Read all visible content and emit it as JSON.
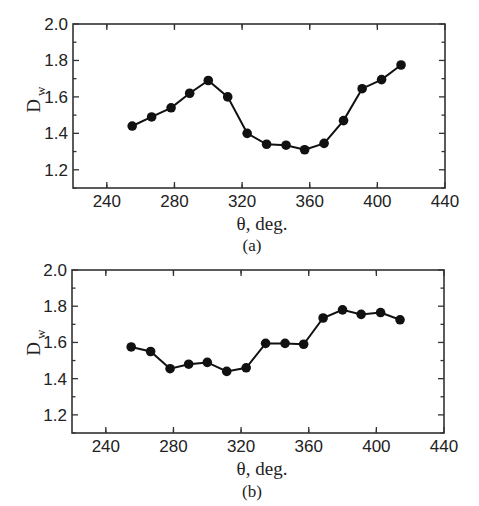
{
  "chart_data": [
    {
      "type": "line",
      "panel_label": "(a)",
      "title": "",
      "xlabel": "θ, deg.",
      "ylabel": "D_w",
      "xlim": [
        220,
        440
      ],
      "ylim": [
        1.1,
        2.0
      ],
      "xticks": [
        240,
        280,
        320,
        360,
        400,
        440
      ],
      "yticks": [
        1.2,
        1.4,
        1.6,
        1.8,
        2.0
      ],
      "xtick_labels": [
        "240",
        "280",
        "320",
        "360",
        "400",
        "440"
      ],
      "ytick_labels": [
        "1.2",
        "1.4",
        "1.6",
        "1.8",
        "2.0"
      ],
      "grid": false,
      "series": [
        {
          "name": "D_w",
          "marker": "filled-circle",
          "x": [
            255,
            266.5,
            278,
            289,
            300,
            311.5,
            323,
            334.5,
            346,
            357,
            368.5,
            380,
            391,
            402.5,
            414
          ],
          "values": [
            1.44,
            1.49,
            1.54,
            1.62,
            1.69,
            1.6,
            1.4,
            1.34,
            1.335,
            1.31,
            1.345,
            1.47,
            1.645,
            1.695,
            1.775
          ]
        }
      ]
    },
    {
      "type": "line",
      "panel_label": "(b)",
      "title": "",
      "xlabel": "θ, deg.",
      "ylabel": "D_w",
      "xlim": [
        220,
        440
      ],
      "ylim": [
        1.1,
        2.0
      ],
      "xticks": [
        240,
        280,
        320,
        360,
        400,
        440
      ],
      "yticks": [
        1.2,
        1.4,
        1.6,
        1.8,
        2.0
      ],
      "xtick_labels": [
        "240",
        "280",
        "320",
        "360",
        "400",
        "440"
      ],
      "ytick_labels": [
        "1.2",
        "1.4",
        "1.6",
        "1.8",
        "2.0"
      ],
      "grid": false,
      "series": [
        {
          "name": "D_w",
          "marker": "filled-circle",
          "x": [
            255,
            266.5,
            278,
            289,
            300,
            311.5,
            323,
            334.5,
            346,
            357,
            368.5,
            380,
            391,
            402.5,
            414
          ],
          "values": [
            1.575,
            1.55,
            1.455,
            1.48,
            1.49,
            1.44,
            1.46,
            1.595,
            1.595,
            1.59,
            1.735,
            1.78,
            1.755,
            1.765,
            1.725
          ]
        }
      ]
    }
  ],
  "panels": [
    {
      "label": "(a)",
      "xlabel": "θ, deg.",
      "ylabel_main": "D",
      "ylabel_sub": "w"
    },
    {
      "label": "(b)",
      "xlabel": "θ, deg.",
      "ylabel_main": "D",
      "ylabel_sub": "w"
    }
  ]
}
